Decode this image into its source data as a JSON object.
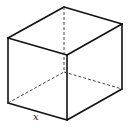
{
  "diagram": {
    "edge_label": "x",
    "vertices": {
      "back_top": [
        64,
        7
      ],
      "right_top": [
        122,
        24
      ],
      "left_top": [
        8,
        38
      ],
      "front_top": [
        67,
        55
      ],
      "back_bottom": [
        64,
        72
      ],
      "left_bottom": [
        8,
        103
      ],
      "right_bottom": [
        122,
        89
      ],
      "front_bottom": [
        67,
        120
      ]
    }
  }
}
